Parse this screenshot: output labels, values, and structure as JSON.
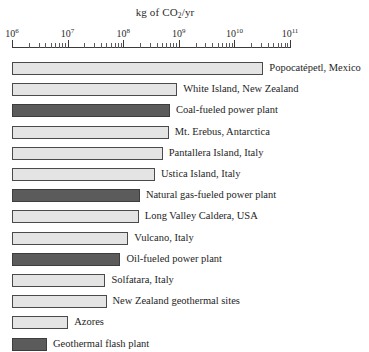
{
  "chart": {
    "type": "bar",
    "orientation": "horizontal",
    "title": "kg of CO2/yr",
    "title_prefix": "kg of CO",
    "title_sub": "2",
    "title_suffix": "/yr",
    "xlabel": "kg of CO2/yr",
    "ylabel": "",
    "x_scale": "log",
    "xlim_exponents": [
      6,
      11
    ],
    "grid": false,
    "legend": false,
    "axis_position": "top",
    "tick_labels": [
      {
        "base": "10",
        "exponent": "6"
      },
      {
        "base": "10",
        "exponent": "7"
      },
      {
        "base": "10",
        "exponent": "8"
      },
      {
        "base": "10",
        "exponent": "9"
      },
      {
        "base": "10",
        "exponent": "10"
      },
      {
        "base": "10",
        "exponent": "11"
      }
    ],
    "colors": {
      "natural_source": "#e4e4e4",
      "power_plant": "#5b5b5b",
      "axis": "#3a3a3a",
      "text": "#1e1e1e"
    },
    "categories": [
      "Popocatépetl, Mexico",
      "White Island, New Zealand",
      "Coal-fueled power plant",
      "Mt. Erebus, Antarctica",
      "Pantallera Island, Italy",
      "Ustica Island, Italy",
      "Natural gas-fueled power plant",
      "Long Valley Caldera, USA",
      "Vulcano, Italy",
      "Oil-fueled power plant",
      "Solfatara, Italy",
      "New Zealand geothermal sites",
      "Azores",
      "Geothermal flash plant"
    ],
    "bars": [
      {
        "label": "Popocatépetl, Mexico",
        "value_exponent": 10.52,
        "kind": "natural"
      },
      {
        "label": "White Island, New Zealand",
        "value_exponent": 8.97,
        "kind": "natural"
      },
      {
        "label": "Coal-fueled power plant",
        "value_exponent": 8.84,
        "kind": "power"
      },
      {
        "label": "Mt. Erebus, Antarctica",
        "value_exponent": 8.82,
        "kind": "natural"
      },
      {
        "label": "Pantallera Island, Italy",
        "value_exponent": 8.71,
        "kind": "natural"
      },
      {
        "label": "Ustica Island, Italy",
        "value_exponent": 8.57,
        "kind": "natural"
      },
      {
        "label": "Natural gas-fueled power plant",
        "value_exponent": 8.3,
        "kind": "power"
      },
      {
        "label": "Long Valley Caldera, USA",
        "value_exponent": 8.28,
        "kind": "natural"
      },
      {
        "label": "Vulcano, Italy",
        "value_exponent": 8.09,
        "kind": "natural"
      },
      {
        "label": "Oil-fueled power plant",
        "value_exponent": 7.95,
        "kind": "power"
      },
      {
        "label": "Solfatara, Italy",
        "value_exponent": 7.68,
        "kind": "natural"
      },
      {
        "label": "New Zealand geothermal sites",
        "value_exponent": 7.7,
        "kind": "natural"
      },
      {
        "label": "Azores",
        "value_exponent": 7.01,
        "kind": "natural"
      },
      {
        "label": "Geothermal flash plant",
        "value_exponent": 6.63,
        "kind": "power"
      }
    ]
  }
}
